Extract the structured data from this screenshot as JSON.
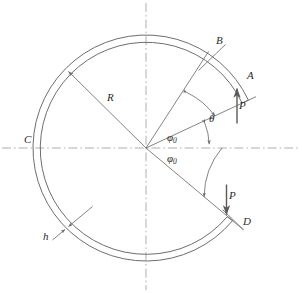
{
  "figure": {
    "type": "engineering-diagram",
    "geometry": {
      "center_x": 146,
      "center_y": 148,
      "outer_radius": 113,
      "inner_radius": 106,
      "gap_start_angle_deg": 25,
      "gap_end_angle_deg": -40,
      "line_color": "#6e6e6e",
      "centerline_color": "#8a8a8a",
      "text_color": "#2b2b2b"
    },
    "labels": {
      "radius": "R",
      "thickness": "h",
      "point_c": "C",
      "point_b": "B",
      "point_a": "A",
      "point_d": "D",
      "force_upper": "P",
      "force_lower": "P",
      "angle_theta": "θ",
      "angle_phi_upper_main": "φ",
      "angle_phi_upper_sub": "0",
      "angle_phi_lower_main": "φ",
      "angle_phi_lower_sub": "0"
    }
  }
}
